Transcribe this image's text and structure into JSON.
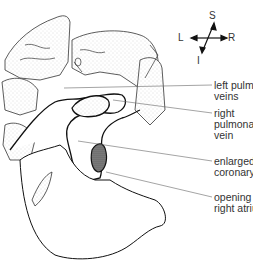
{
  "compass": {
    "superior": "S",
    "inferior": "I",
    "left": "L",
    "right": "R"
  },
  "labels": [
    {
      "id": "left-pulmonary-veins",
      "text": "left pulmonary\nveins"
    },
    {
      "id": "right-pulmonary-vein",
      "text": "right\npulmonary\nvein"
    },
    {
      "id": "enlarged-coronary-sinus",
      "text": "enlarged\ncoronary sinus"
    },
    {
      "id": "opening-to-right-atrium",
      "text": "opening to\nright atrium"
    }
  ],
  "colors": {
    "line": "#222222",
    "leader": "#666666",
    "stipple": "#bdbdbd",
    "text": "#333333"
  }
}
